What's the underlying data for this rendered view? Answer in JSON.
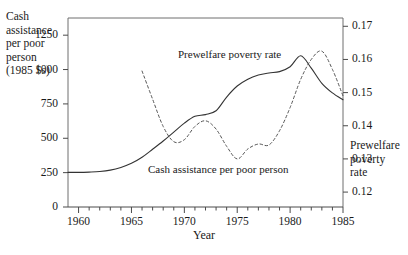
{
  "chart_data": {
    "type": "line",
    "title": "",
    "xlabel": "Year",
    "xlim": [
      1959,
      1985
    ],
    "xticks": [
      1960,
      1965,
      1970,
      1975,
      1980,
      1985
    ],
    "xtick_labels": [
      "1960",
      "1965",
      "1970",
      "1975",
      "1980",
      "1985"
    ],
    "minor_xtick_interval": 1,
    "grid": false,
    "legend_position": "inline-annotations",
    "left_axis": {
      "label": "Cash assistance per poor person (1985 $s)",
      "label_lines": [
        "Cash",
        "assistance",
        "per poor",
        "person",
        "(1985 $s)"
      ],
      "ylim": [
        0,
        1375
      ],
      "ticks": [
        0,
        250,
        500,
        750,
        1000,
        1250
      ],
      "tick_labels": [
        "0",
        "250",
        "500",
        "750",
        "1000",
        "1250"
      ]
    },
    "right_axis": {
      "label": "Prewelfare poverty rate",
      "label_lines": [
        "Prewelfare",
        "poverty",
        "rate"
      ],
      "ylim": [
        0.1155,
        0.1725
      ],
      "ticks": [
        0.12,
        0.13,
        0.14,
        0.15,
        0.16,
        0.17
      ],
      "tick_labels": [
        "0.12",
        "0.13",
        "0.14",
        "0.15",
        "0.16",
        "0.17"
      ]
    },
    "series": [
      {
        "name": "Cash assistance per poor person",
        "annotation": "Cash assistance per poor person",
        "axis": "left",
        "style": "solid",
        "color": "#333333",
        "x": [
          1959,
          1960,
          1961,
          1962,
          1963,
          1964,
          1965,
          1966,
          1967,
          1968,
          1969,
          1970,
          1971,
          1972,
          1973,
          1974,
          1975,
          1976,
          1977,
          1978,
          1979,
          1980,
          1981,
          1982,
          1983,
          1984,
          1985
        ],
        "values": [
          252,
          252,
          254,
          258,
          268,
          288,
          318,
          362,
          420,
          480,
          545,
          610,
          660,
          672,
          700,
          800,
          880,
          930,
          960,
          975,
          985,
          1020,
          1100,
          1010,
          900,
          830,
          780
        ]
      },
      {
        "name": "Prewelfare poverty rate",
        "annotation": "Prewelfare poverty rate",
        "axis": "right",
        "style": "dashed",
        "color": "#555555",
        "x": [
          1966,
          1967,
          1968,
          1969,
          1970,
          1971,
          1972,
          1973,
          1974,
          1975,
          1976,
          1977,
          1978,
          1979,
          1980,
          1981,
          1982,
          1983,
          1984,
          1985
        ],
        "values": [
          0.1565,
          0.148,
          0.1398,
          0.1352,
          0.1358,
          0.1398,
          0.1415,
          0.139,
          0.1338,
          0.13,
          0.133,
          0.1345,
          0.1342,
          0.1385,
          0.1455,
          0.154,
          0.16,
          0.1625,
          0.157,
          0.149
        ]
      }
    ]
  }
}
